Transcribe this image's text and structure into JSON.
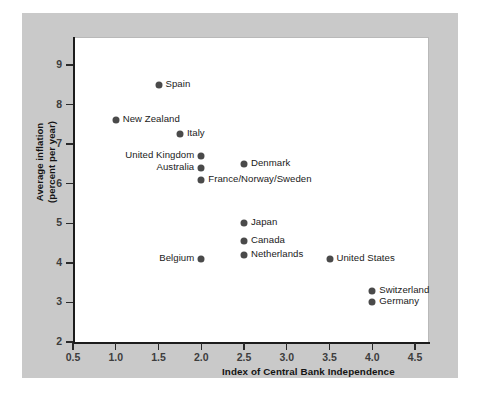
{
  "chart_data": {
    "type": "scatter",
    "title": "",
    "xlabel": "Index of Central Bank Independence",
    "ylabel": "Average inflation (percent per year)",
    "ylabel_line1": "Average inflation",
    "ylabel_line2": "(percent per year)",
    "xlim": [
      0.5,
      4.75
    ],
    "ylim": [
      2,
      9.3
    ],
    "xticks": [
      0.5,
      1.0,
      1.5,
      2.0,
      2.5,
      3.0,
      3.5,
      4.0,
      4.5
    ],
    "xtick_labels": [
      "0.5",
      "1.0",
      "1.5",
      "2.0",
      "2.5",
      "3.0",
      "3.5",
      "4.0",
      "4.5"
    ],
    "yticks": [
      2,
      3,
      4,
      5,
      6,
      7,
      8,
      9
    ],
    "ytick_labels": [
      "2",
      "3",
      "4",
      "5",
      "6",
      "7",
      "8",
      "9"
    ],
    "grid": false,
    "legend": "none",
    "marker_color": "#4a4a4a",
    "points": [
      {
        "label": "Spain",
        "x": 1.5,
        "y": 8.5,
        "label_side": "right"
      },
      {
        "label": "New Zealand",
        "x": 1.0,
        "y": 7.6,
        "label_side": "right"
      },
      {
        "label": "Italy",
        "x": 1.75,
        "y": 7.25,
        "label_side": "right"
      },
      {
        "label": "United Kingdom",
        "x": 2.0,
        "y": 6.7,
        "label_side": "left"
      },
      {
        "label": "Denmark",
        "x": 2.5,
        "y": 6.5,
        "label_side": "right"
      },
      {
        "label": "Australia",
        "x": 2.0,
        "y": 6.4,
        "label_side": "left"
      },
      {
        "label": "France/Norway/Sweden",
        "x": 2.0,
        "y": 6.1,
        "label_side": "right"
      },
      {
        "label": "Japan",
        "x": 2.5,
        "y": 5.0,
        "label_side": "right"
      },
      {
        "label": "Canada",
        "x": 2.5,
        "y": 4.55,
        "label_side": "right"
      },
      {
        "label": "Netherlands",
        "x": 2.5,
        "y": 4.2,
        "label_side": "right"
      },
      {
        "label": "Belgium",
        "x": 2.0,
        "y": 4.1,
        "label_side": "left"
      },
      {
        "label": "United States",
        "x": 3.5,
        "y": 4.1,
        "label_side": "right"
      },
      {
        "label": "Switzerland",
        "x": 4.0,
        "y": 3.3,
        "label_side": "right"
      },
      {
        "label": "Germany",
        "x": 4.0,
        "y": 3.0,
        "label_side": "right"
      }
    ]
  },
  "colors": {
    "mat": "#c9c9c9",
    "canvas": "#ffffff",
    "axis": "#1c1c1c",
    "marker": "#4a4a4a",
    "tick_text": "#3d3d3d",
    "title_text": "#141414"
  }
}
